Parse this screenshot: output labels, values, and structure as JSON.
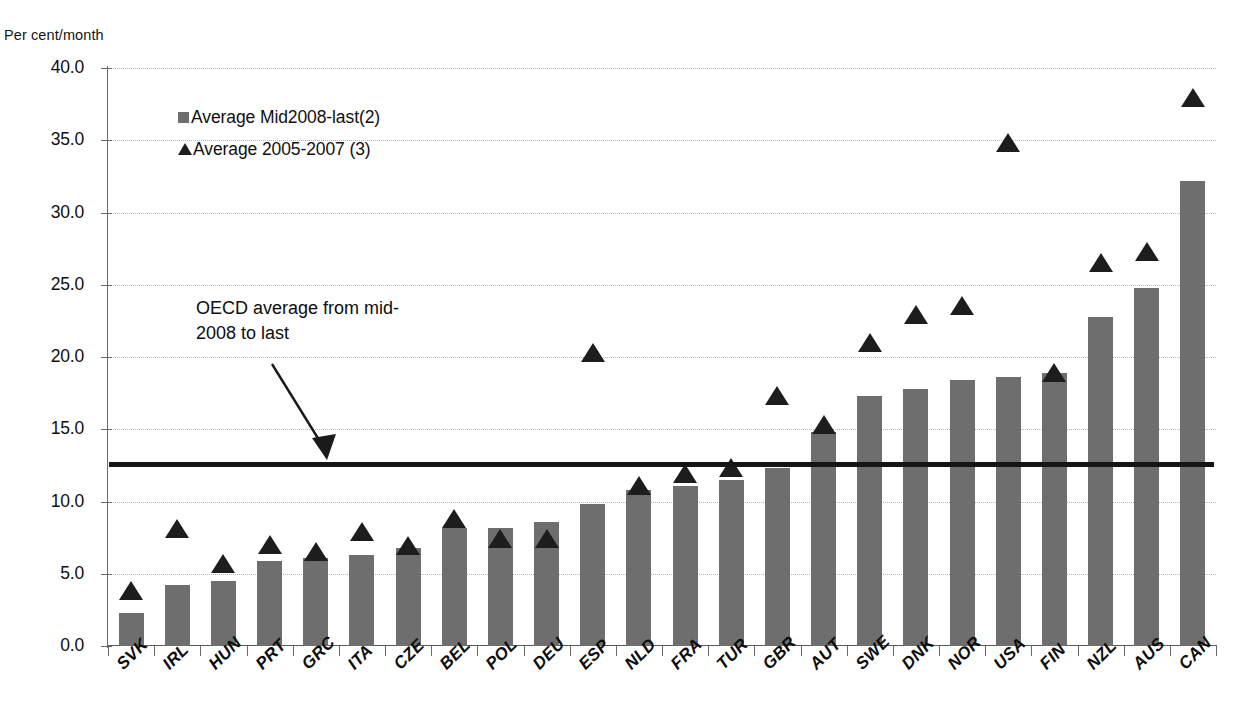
{
  "figure": {
    "y_unit_label": "Per cent/month",
    "faint_top_title": ""
  },
  "legend": {
    "position": "top-left-inside",
    "items": [
      {
        "marker": "square-marker",
        "label": "Average Mid2008-last(2)",
        "color": "#6e6e6e"
      },
      {
        "marker": "triangle-marker",
        "label": "Average 2005-2007 (3)",
        "color": "#1d1d1d"
      }
    ]
  },
  "annotation": {
    "line1": "OECD average from mid-",
    "line2": "2008 to last",
    "arrow": "annotation-arrow"
  },
  "reference_line": {
    "name": "oecd-average-line",
    "value": 12.6,
    "color": "#151515"
  },
  "axes": {
    "y_ticks": [
      "0.0",
      "5.0",
      "10.0",
      "15.0",
      "20.0",
      "25.0",
      "30.0",
      "35.0",
      "40.0"
    ],
    "y_min": 0,
    "y_max": 40,
    "y_step": 5,
    "grid": true
  },
  "chart_data": {
    "type": "bar",
    "title": "",
    "subtitle": "",
    "xlabel": "",
    "ylabel": "Per cent/month",
    "ylim": [
      0,
      40
    ],
    "yticks": [
      0,
      5,
      10,
      15,
      20,
      25,
      30,
      35,
      40
    ],
    "grid": true,
    "legend_position": "top-left-inside",
    "categories": [
      "SVK",
      "IRL",
      "HUN",
      "PRT",
      "GRC",
      "ITA",
      "CZE",
      "BEL",
      "POL",
      "DEU",
      "ESP",
      "NLD",
      "FRA",
      "TUR",
      "GBR",
      "AUT",
      "SWE",
      "DNK",
      "NOR",
      "USA",
      "FIN",
      "NZL",
      "AUS",
      "CAN"
    ],
    "series": [
      {
        "name": "Average Mid2008-last(2)",
        "type": "bar",
        "color": "#6e6e6e",
        "values": [
          2.3,
          4.2,
          4.5,
          5.9,
          6.1,
          6.3,
          6.8,
          8.2,
          8.2,
          8.6,
          9.8,
          10.8,
          11.1,
          11.5,
          12.3,
          14.8,
          17.3,
          17.8,
          18.4,
          18.6,
          18.9,
          22.8,
          24.8,
          32.2
        ]
      },
      {
        "name": "Average 2005-2007 (3)",
        "type": "scatter-triangle",
        "color": "#1d1d1d",
        "values": [
          3.8,
          8.1,
          5.7,
          7.0,
          6.5,
          7.9,
          6.9,
          8.8,
          7.4,
          7.4,
          20.3,
          11.1,
          11.9,
          12.3,
          17.3,
          15.3,
          21.0,
          22.9,
          23.5,
          34.8,
          18.9,
          26.5,
          27.3,
          37.9
        ]
      }
    ],
    "reference_lines": [
      {
        "label": "OECD average from mid-2008 to last",
        "value": 12.6,
        "orientation": "horizontal",
        "color": "#151515"
      }
    ]
  }
}
